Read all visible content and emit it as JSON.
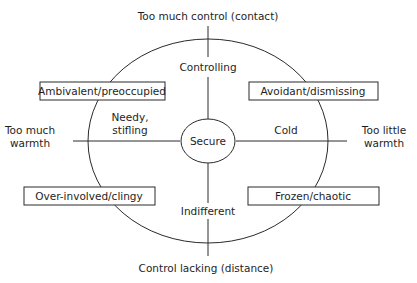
{
  "diagram": {
    "axes": {
      "top": "Too much control (contact)",
      "bottom": "Control lacking (distance)",
      "left": [
        "Too much",
        "warmth"
      ],
      "right": [
        "Too little",
        "warmth"
      ]
    },
    "inner_labels": {
      "top": "Controlling",
      "bottom": "Indifferent",
      "left": [
        "Needy,",
        "stifling"
      ],
      "right": "Cold"
    },
    "center": "Secure",
    "quadrant_boxes": {
      "top_left": "Ambivalent/preoccupied",
      "top_right": "Avoidant/dismissing",
      "bottom_left": "Over-involved/clingy",
      "bottom_right": "Frozen/chaotic"
    },
    "colors": {
      "line": "#2a2a2a",
      "text": "#1e1e1e",
      "background": "#ffffff"
    }
  }
}
